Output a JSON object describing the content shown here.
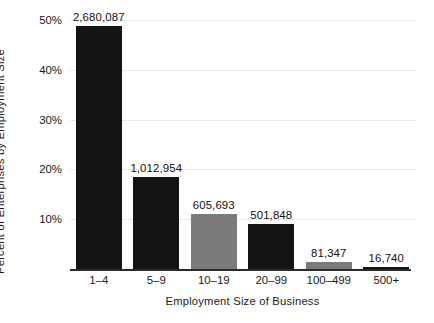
{
  "chart_data": {
    "type": "bar",
    "title": "",
    "xlabel": "Employment Size of Business",
    "ylabel": "Percent of Enterprises by Employment Size",
    "categories": [
      "1–4",
      "5–9",
      "10–19",
      "20–99",
      "100–499",
      "500+"
    ],
    "values": [
      48.7,
      18.4,
      11.0,
      9.1,
      1.5,
      0.3
    ],
    "data_labels": [
      "2,680,087",
      "1,012,954",
      "605,693",
      "501,848",
      "81,347",
      "16,740"
    ],
    "counts": [
      2680087,
      1012954,
      605693,
      501848,
      81347,
      16740
    ],
    "bar_colors": [
      "#141414",
      "#141414",
      "#7a7a7a",
      "#141414",
      "#7a7a7a",
      "#141414"
    ],
    "ylim": [
      0,
      50
    ],
    "ytick_values": [
      10,
      20,
      30,
      40,
      50
    ],
    "ytick_labels": [
      "10%",
      "20%",
      "30%",
      "40%",
      "50%"
    ],
    "grid": true,
    "grid_axis": "y",
    "grid_style": "dotted",
    "grid_color": "#d4d4d4",
    "legend": false,
    "legend_position": "none",
    "axis_color": "#2a2a2a",
    "background_color": "#ffffff",
    "text_color": "#1a1a1a"
  }
}
